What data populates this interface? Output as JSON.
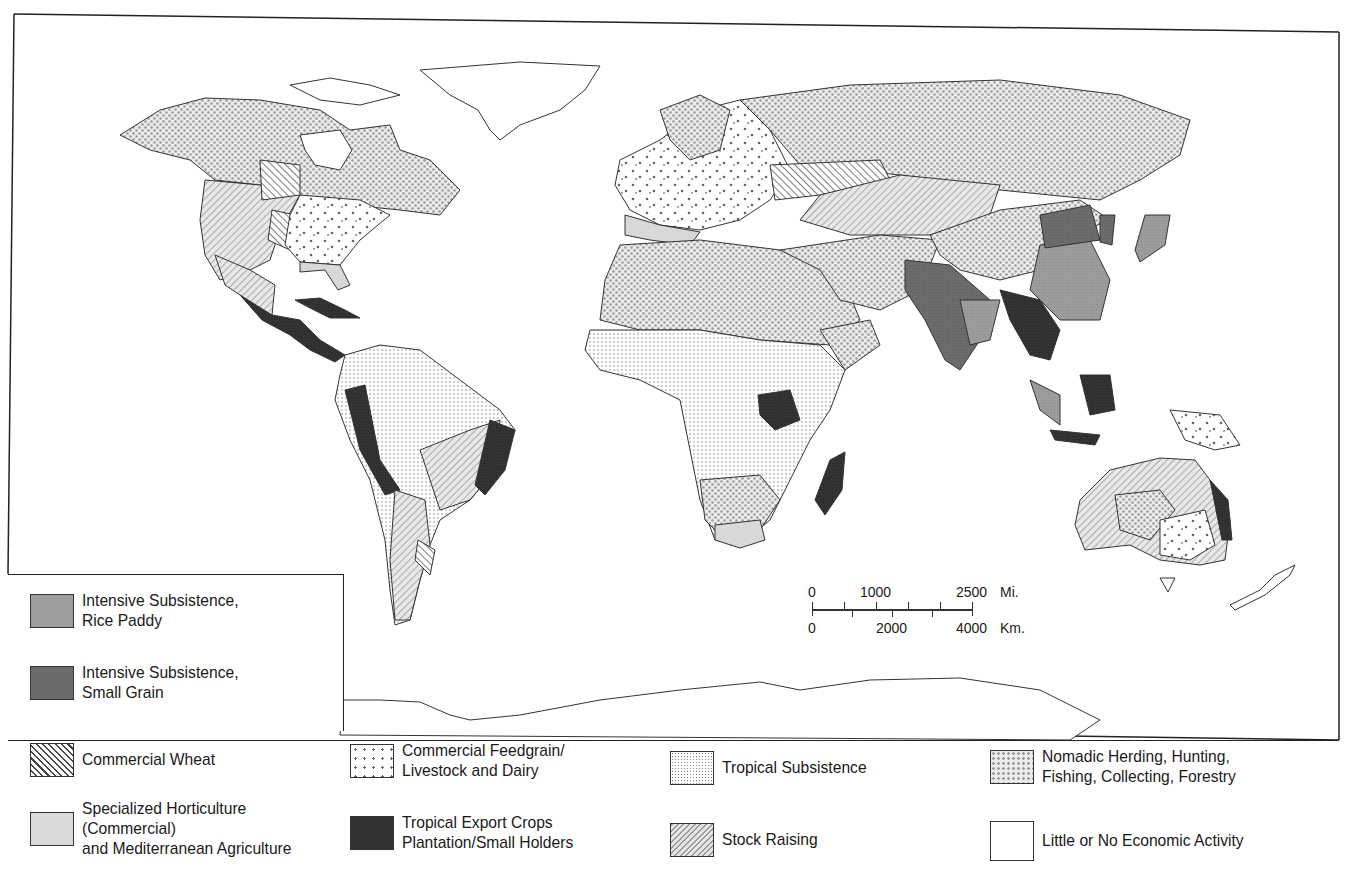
{
  "legend": {
    "inset_items": [
      {
        "id": "rice-paddy",
        "label": "Intensive Subsistence,\nRice Paddy",
        "pattern": "solid-medium-gray",
        "color": "#9a9a9a"
      },
      {
        "id": "small-grain",
        "label": "Intensive Subsistence,\nSmall Grain",
        "pattern": "solid-dark-gray",
        "color": "#6a6a6a"
      }
    ],
    "bottom_items": [
      {
        "id": "commercial-wheat",
        "label": "Commercial Wheat",
        "pattern": "diagonal-hatch-back",
        "color": "#444444"
      },
      {
        "id": "horticulture",
        "label": "Specialized Horticulture\n(Commercial)\nand Mediterranean Agriculture",
        "pattern": "solid-light-gray",
        "color": "#d4d4d4"
      },
      {
        "id": "feedgrain",
        "label": "Commercial Feedgrain/\nLivestock and Dairy",
        "pattern": "sparse-dots",
        "color": "#555555"
      },
      {
        "id": "tropical-export",
        "label": "Tropical Export Crops\nPlantation/Small Holders",
        "pattern": "solid-black",
        "color": "#2a2a2a"
      },
      {
        "id": "tropical-subsistence",
        "label": "Tropical Subsistence",
        "pattern": "fine-dots",
        "color": "#888888"
      },
      {
        "id": "stock-raising",
        "label": "Stock Raising",
        "pattern": "diagonal-hatch-forward",
        "color": "#999999"
      },
      {
        "id": "nomadic",
        "label": "Nomadic Herding, Hunting,\nFishing, Collecting, Forestry",
        "pattern": "dense-crosshatch-dots",
        "color": "#aaaaaa"
      },
      {
        "id": "little-none",
        "label": "Little or No Economic Activity",
        "pattern": "blank",
        "color": "#ffffff"
      }
    ]
  },
  "scale_bar": {
    "miles_labels": [
      "0",
      "1000",
      "2500"
    ],
    "miles_unit": "Mi.",
    "km_labels": [
      "0",
      "2000",
      "4000"
    ],
    "km_unit": "Km."
  },
  "regions": [
    "North America",
    "Central America",
    "South America",
    "Europe",
    "Africa",
    "Asia",
    "Southeast Asia",
    "Australia",
    "New Zealand",
    "Greenland",
    "Antarctica"
  ]
}
